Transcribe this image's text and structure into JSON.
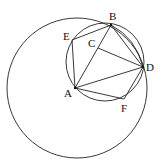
{
  "diagram": {
    "type": "geometry",
    "stroke_color": "#222222",
    "background": "#ffffff",
    "points": {
      "A": {
        "label": "A",
        "x": 75,
        "y": 88
      },
      "B": {
        "label": "B",
        "x": 111,
        "y": 25
      },
      "C": {
        "label": "C",
        "x": 98,
        "y": 48
      },
      "D": {
        "label": "D",
        "x": 143,
        "y": 67
      },
      "E": {
        "label": "E",
        "x": 72,
        "y": 40
      },
      "F": {
        "label": "F",
        "x": 124,
        "y": 99
      }
    },
    "circles": [
      {
        "name": "large-circle-centered-A",
        "cx": 77,
        "cy": 88,
        "r": 70
      },
      {
        "name": "small-circle",
        "cx": 105,
        "cy": 62,
        "r": 39
      }
    ],
    "segments": [
      [
        "A",
        "E"
      ],
      [
        "E",
        "B"
      ],
      [
        "A",
        "B"
      ],
      [
        "B",
        "D"
      ],
      [
        "C",
        "D"
      ],
      [
        "A",
        "D"
      ],
      [
        "A",
        "F"
      ],
      [
        "F",
        "D"
      ]
    ]
  }
}
